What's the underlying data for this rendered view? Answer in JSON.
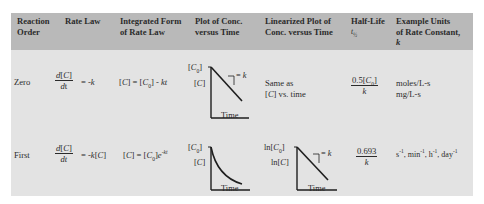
{
  "table": {
    "colors": {
      "header_bg": "#b9b9b9",
      "body_bg": "#e3e3e3",
      "text": "#2b2b2b"
    },
    "headers": [
      "Reaction Order",
      "Rate Law",
      "Integrated Form of Rate Law",
      "Plot of Conc. versus Time",
      "Linearized Plot of Conc. versus Time",
      "Half-Life t½",
      "Example Units of Rate Constant, k"
    ],
    "header_lines": {
      "order": [
        "Reaction",
        "Order"
      ],
      "rate_law": [
        "Rate Law"
      ],
      "integrated": [
        "Integrated Form",
        "of Rate Law"
      ],
      "plot": [
        "Plot of Conc.",
        "versus Time"
      ],
      "linearized": [
        "Linearized Plot of",
        "Conc. versus Time"
      ],
      "half_life": [
        "Half-Life",
        "t½"
      ],
      "units": [
        "Example Units",
        "of Rate Constant,",
        "k"
      ]
    },
    "rows": [
      {
        "order": "Zero",
        "rate_law": {
          "numerator": "d[C]",
          "denominator": "dt",
          "rhs": "= -k"
        },
        "integrated": "[C] = [C0] - kt",
        "plot": {
          "y_top_label": "[C0]",
          "y_label": "[C]",
          "x_label": "Time",
          "slope_label": "= k",
          "shape": "linear"
        },
        "linearized": [
          "Same as",
          "[C] vs. time"
        ],
        "half_life": {
          "numerator": "0.5[C0]",
          "denominator": "k"
        },
        "units": [
          "moles/L-s",
          "mg/L-s"
        ]
      },
      {
        "order": "First",
        "rate_law": {
          "numerator": "d[C]",
          "denominator": "dt",
          "rhs": "= -k[C]"
        },
        "integrated": "[C] = [C0]e^-kt",
        "plot": {
          "y_top_label": "[C0]",
          "y_label": "[C]",
          "x_label": "Time",
          "shape": "exponential-decay"
        },
        "linearized": {
          "y_top_label": "ln[C0]",
          "y_label": "ln[C]",
          "x_label": "Time",
          "slope_label": "= k",
          "shape": "linear"
        },
        "half_life": {
          "numerator": "0.693",
          "denominator": "k"
        },
        "units": "s-1, min-1, h-1, day-1"
      }
    ]
  }
}
